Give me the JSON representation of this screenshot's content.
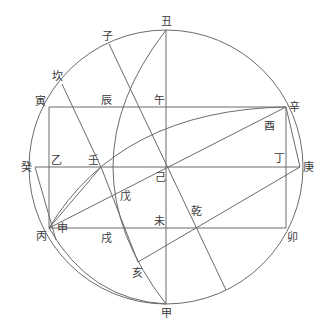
{
  "diagram": {
    "type": "geometric-construction",
    "stroke_color": "#6b6b6b",
    "label_color": "#3a3a3a",
    "circle": {
      "cx": 166,
      "cy": 167,
      "r": 137
    },
    "labels": {
      "chou": "丑",
      "zi": "子",
      "kan": "坎",
      "yin": "寅",
      "chen": "辰",
      "wu": "午",
      "xin": "辛",
      "you": "酉",
      "gui": "癸",
      "yi": "乙",
      "ren": "壬",
      "ji": "己",
      "ding": "丁",
      "geng": "庚",
      "wu_earth": "戊",
      "qian": "乾",
      "wei": "未",
      "bing": "丙",
      "shen": "申",
      "xu": "戌",
      "hai": "亥",
      "mao": "卯",
      "jia": "甲"
    }
  }
}
